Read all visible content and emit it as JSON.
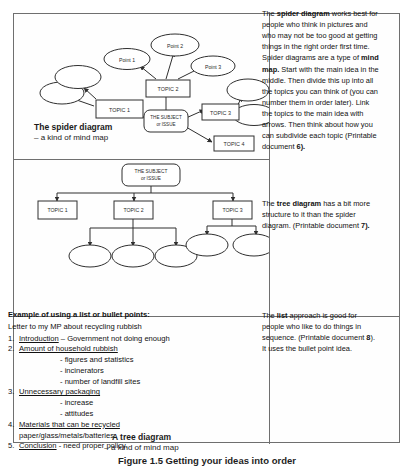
{
  "figure": {
    "caption": "Figure 1.5 Getting your ideas into order"
  },
  "spider": {
    "caption_title": "The spider diagram",
    "caption_sub": "– a kind of mind map",
    "center": "THE SUBJECT\nor ISSUE",
    "center_line1": "THE SUBJECT",
    "center_line2": "or ISSUE",
    "topics": [
      "TOPIC 1",
      "TOPIC 2",
      "TOPIC 3",
      "TOPIC 4"
    ],
    "points": [
      "Point 1",
      "Point 2",
      "Point 3"
    ]
  },
  "tree": {
    "caption_title": "A tree diagram",
    "caption_sub": "– a kind of mind map",
    "center_line1": "THE SUBJECT",
    "center_line2": "or ISSUE",
    "topics": [
      "TOPIC 1",
      "TOPIC 2",
      "TOPIC 3"
    ]
  },
  "list_panel": {
    "title": "Example of using a list or bullet points:",
    "subtitle": "Letter to my MP about recycling rubbish",
    "items": [
      {
        "num": "1.",
        "heading": "Introduction",
        "tail": " – Government not doing enough",
        "subs": []
      },
      {
        "num": "2.",
        "heading": "Amount of household rubbish",
        "tail": "",
        "subs": [
          "- figures and statistics",
          "- incinerators",
          "- number of landfill sites"
        ]
      },
      {
        "num": "3.",
        "heading": "Unnecessary packaging",
        "tail": "",
        "subs": [
          "- increase",
          "- attitudes"
        ]
      },
      {
        "num": "4.",
        "heading": "Materials that can be recycled",
        "tail": "",
        "subs": [],
        "plain_line": "paper/glass/metals/batteries"
      },
      {
        "num": "5.",
        "heading": "Conclusion",
        "tail": " - need proper policy.",
        "subs": []
      }
    ]
  },
  "sidebar": {
    "spider_text": {
      "p1_a": "The ",
      "p1_b": "spider diagram",
      "p1_c": " works best for people who think in pictures and who may not be too good at getting things in the right order first time. Spider diagrams are a type of ",
      "p1_d": "mind map.",
      "p1_e": " Start with the main idea in the middle. Then divide this up into all the topics you can think of (you can number them in order later). Link the topics to the main idea with arrows. Then think about how you can subdivide each topic (Printable document ",
      "p1_f": "6",
      "p1_g": ")."
    },
    "tree_text": {
      "p1_a": "The ",
      "p1_b": "tree diagram",
      "p1_c": " has a bit more structure to it than the spider diagram. (Printable document ",
      "p1_d": "7",
      "p1_e": ")."
    },
    "list_text": {
      "p1_a": "The ",
      "p1_b": "list",
      "p1_c": " approach is good for people who like to do things in sequence. (Printable document ",
      "p1_d": "8",
      "p1_e": "). It uses the bullet point idea."
    }
  },
  "colors": {
    "frame": "#6f6f6f",
    "stroke": "#3a3a3a",
    "text": "#111111",
    "background": "#ffffff"
  }
}
